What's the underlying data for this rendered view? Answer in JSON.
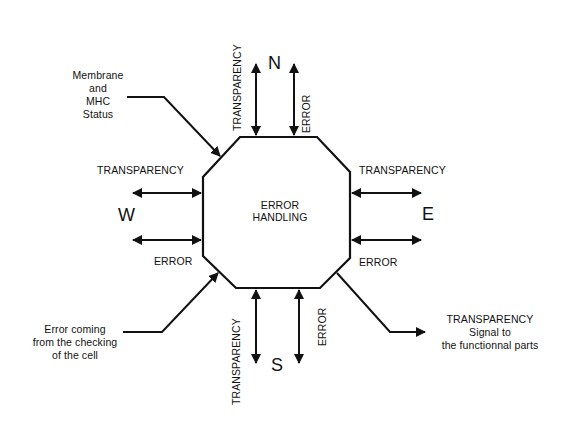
{
  "diagram": {
    "center_label": [
      "ERROR",
      "HANDLING"
    ],
    "directions": {
      "north": "N",
      "south": "S",
      "west": "W",
      "east": "E"
    },
    "port_labels": {
      "north_transparency": "TRANSPARENCY",
      "north_error": "ERROR",
      "south_transparency": "TRANSPARENCY",
      "south_error": "ERROR",
      "west_transparency": "TRANSPARENCY",
      "west_error": "ERROR",
      "east_transparency": "TRANSPARENCY",
      "east_error": "ERROR"
    },
    "input_membrane": [
      "Membrane",
      "and",
      "MHC",
      "Status"
    ],
    "input_error": [
      "Error coming",
      "from the checking",
      "of the cell"
    ],
    "output_transparency": [
      "TRANSPARENCY",
      "Signal to",
      "the functionnal parts"
    ],
    "colors": {
      "stroke": "#111111",
      "background": "#ffffff"
    }
  }
}
